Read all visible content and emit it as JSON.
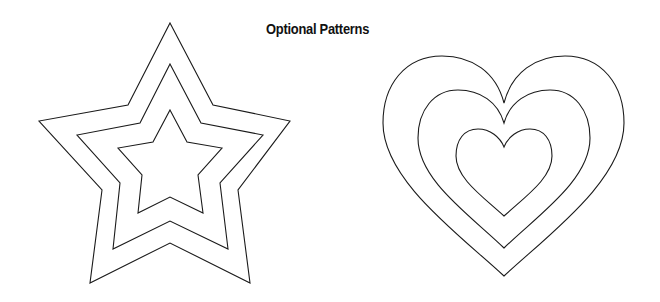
{
  "page": {
    "title": "Optional Patterns",
    "background": "#ffffff",
    "stroke_color": "#1a1a1a"
  },
  "patterns": [
    {
      "name": "star",
      "outlines": 3
    },
    {
      "name": "heart",
      "outlines": 3
    }
  ]
}
